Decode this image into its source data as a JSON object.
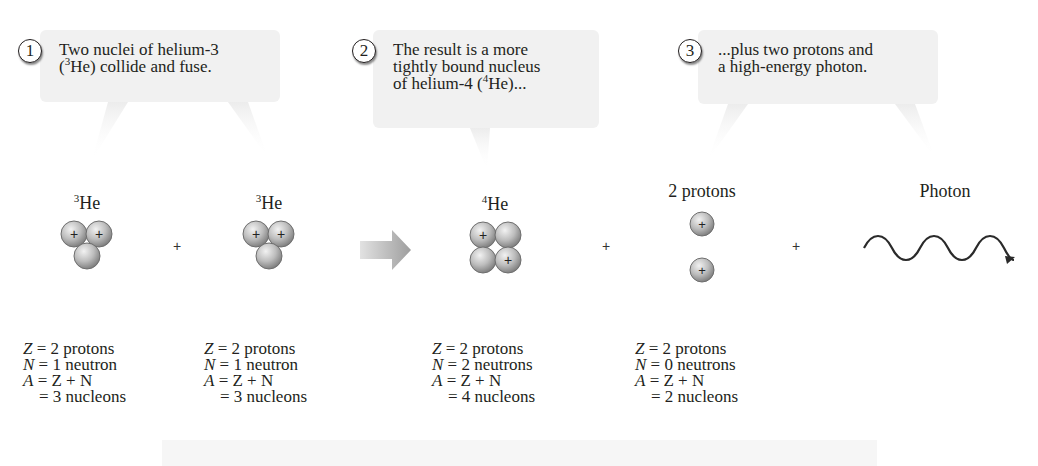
{
  "callouts": [
    {
      "number": "1",
      "line1": "Two nuclei of helium-3",
      "line2_pre": "(",
      "line2_sup": "3",
      "line2_post": "He) collide and fuse.",
      "line3": ""
    },
    {
      "number": "2",
      "line1": "The result is a more",
      "line2": "tightly bound nucleus",
      "line3_pre": "of helium-4 (",
      "line3_sup": "4",
      "line3_post": "He)..."
    },
    {
      "number": "3",
      "line1": "...plus two protons and",
      "line2": "a high-energy photon."
    }
  ],
  "particles": [
    {
      "sup": "3",
      "name": "He"
    },
    {
      "sup": "3",
      "name": "He"
    },
    {
      "sup": "4",
      "name": "He"
    },
    {
      "label": "2 protons"
    },
    {
      "label": "Photon"
    }
  ],
  "operators": {
    "plus": "+"
  },
  "proton_sign": "+",
  "equations": [
    {
      "z": "Z",
      "z_val": "= 2 protons",
      "n": "N",
      "n_val": "= 1 neutron",
      "a": "A",
      "a_eq": "= Z + N",
      "total": "= 3 nucleons"
    },
    {
      "z": "Z",
      "z_val": "= 2 protons",
      "n": "N",
      "n_val": "= 1 neutron",
      "a": "A",
      "a_eq": "= Z + N",
      "total": "= 3 nucleons"
    },
    {
      "z": "Z",
      "z_val": "= 2 protons",
      "n": "N",
      "n_val": "= 2 neutrons",
      "a": "A",
      "a_eq": "= Z + N",
      "total": "= 4 nucleons"
    },
    {
      "z": "Z",
      "z_val": "= 2 protons",
      "n": "N",
      "n_val": "= 0 neutrons",
      "a": "A",
      "a_eq": "= Z + N",
      "total": "= 2 nucleons"
    }
  ],
  "colors": {
    "callout_bg": "#f1f1f1",
    "nucleon_light": "#e6e6e6",
    "nucleon_dark": "#8a8a8a",
    "arrow": "#a9a9a9",
    "text": "#231f20"
  }
}
